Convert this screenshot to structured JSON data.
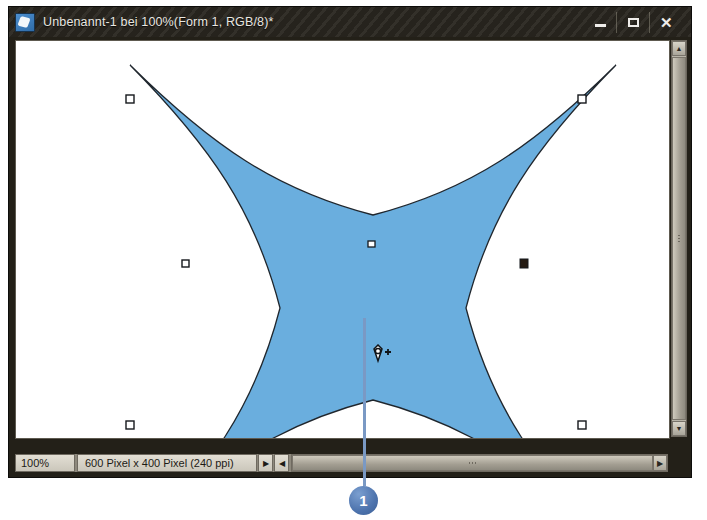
{
  "window": {
    "title": "Unbenannt-1 bei 100%(Form 1, RGB/8)*",
    "app_icon": "photoshop-document-icon",
    "buttons": {
      "minimize": "minimize-icon",
      "maximize": "maximize-icon",
      "close": "✕"
    }
  },
  "status_bar": {
    "zoom": "100%",
    "dimensions": "600 Pixel x 400 Pixel (240 ppi)",
    "expand_arrow": "▶",
    "collapse_arrow": "◀"
  },
  "scrollbars": {
    "up_arrow": "▲",
    "down_arrow": "▼",
    "left_arrow": "◀",
    "right_arrow": "▶"
  },
  "canvas": {
    "shape_name": "four-pointed-star-path",
    "fill_color": "#6aaede",
    "stroke_color": "#1d2227",
    "background": "#ffffff",
    "cursor": "pen-tool-add-anchor-point",
    "anchor_points": [
      {
        "name": "anchor-top-left",
        "x": 120,
        "y": 94,
        "selected": false
      },
      {
        "name": "anchor-top-center",
        "x": 363,
        "y": 238,
        "selected": false
      },
      {
        "name": "anchor-top-right",
        "x": 572,
        "y": 94,
        "selected": false
      },
      {
        "name": "anchor-mid-left",
        "x": 176,
        "y": 258,
        "selected": false
      },
      {
        "name": "anchor-mid-right",
        "x": 515,
        "y": 258,
        "selected": true
      },
      {
        "name": "anchor-bottom-left",
        "x": 120,
        "y": 421,
        "selected": false
      },
      {
        "name": "anchor-bottom-right",
        "x": 572,
        "y": 421,
        "selected": false
      }
    ]
  },
  "annotation": {
    "badge_label": "1",
    "badge_color": "#4d73ad",
    "line_color": "#7a99c4"
  }
}
